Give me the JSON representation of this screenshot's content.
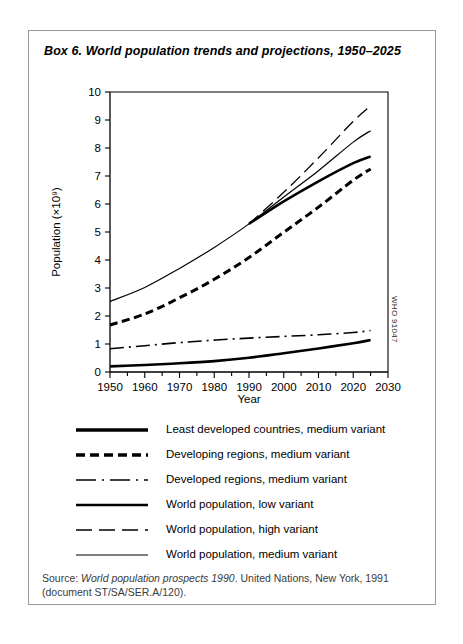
{
  "box": {
    "title": "Box 6. World population trends and projections, 1950–2025",
    "who_code": "WHO 91047"
  },
  "source": {
    "prefix": "Source: ",
    "italic_part": "World population prospects 1990",
    "rest": ". United Nations, New York, 1991 (document ST/SA/SER.A/120)."
  },
  "legend": {
    "items": [
      {
        "label": "Least developed countries, medium variant",
        "style": "thick-solid"
      },
      {
        "label": "Developing regions, medium variant",
        "style": "thick-dashed"
      },
      {
        "label": "Developed regions, medium variant",
        "style": "dash-dot"
      },
      {
        "label": "World population, low variant",
        "style": "thick-solid"
      },
      {
        "label": "World population, high variant",
        "style": "long-dash"
      },
      {
        "label": "World population, medium variant",
        "style": "thin-solid"
      }
    ]
  },
  "chart_data": {
    "type": "line",
    "title": "Box 6. World population trends and projections, 1950–2025",
    "xlabel": "Year",
    "ylabel": "Population (×10⁹)",
    "xlim": [
      1950,
      2030
    ],
    "ylim": [
      0,
      10
    ],
    "xticks": [
      1950,
      1960,
      1970,
      1980,
      1990,
      2000,
      2010,
      2020,
      2030
    ],
    "yticks": [
      0,
      1,
      2,
      3,
      4,
      5,
      6,
      7,
      8,
      9,
      10
    ],
    "minor_xtick_interval": 5,
    "grid": false,
    "legend_position": "below",
    "x": [
      1950,
      1960,
      1970,
      1980,
      1990,
      2000,
      2010,
      2020,
      2025
    ],
    "series": [
      {
        "name": "World population, medium variant",
        "style": "thin-solid",
        "values": [
          2.52,
          3.02,
          3.7,
          4.45,
          5.29,
          6.25,
          7.19,
          8.21,
          8.62
        ]
      },
      {
        "name": "World population, high variant",
        "style": "long-dash",
        "values": [
          null,
          null,
          null,
          null,
          5.29,
          6.42,
          7.65,
          8.95,
          9.5
        ]
      },
      {
        "name": "World population, low variant",
        "style": "thick-solid",
        "values": [
          null,
          null,
          null,
          null,
          5.29,
          6.09,
          6.81,
          7.46,
          7.7
        ]
      },
      {
        "name": "Developing regions, medium variant",
        "style": "thick-dashed",
        "values": [
          1.68,
          2.07,
          2.65,
          3.31,
          4.09,
          4.99,
          5.89,
          6.85,
          7.25
        ]
      },
      {
        "name": "Developed regions, medium variant",
        "style": "dash-dot",
        "values": [
          0.83,
          0.94,
          1.05,
          1.14,
          1.21,
          1.27,
          1.33,
          1.41,
          1.48
        ]
      },
      {
        "name": "Least developed countries, medium variant",
        "style": "thick-solid",
        "values": [
          0.2,
          0.25,
          0.31,
          0.39,
          0.51,
          0.67,
          0.84,
          1.03,
          1.14
        ]
      }
    ]
  }
}
